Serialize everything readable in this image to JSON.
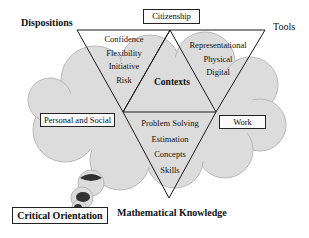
{
  "diagram": {
    "type": "numeracy model",
    "outer_labels": {
      "top_left": "Dispositions",
      "top_right": "Tools",
      "bottom_center": "Mathematical Knowledge"
    },
    "boxes": {
      "top": "Citizenship",
      "left": "Personal and Social",
      "right": "Work",
      "bottom_left": "Critical Orientation"
    },
    "center_label": "Contexts",
    "triangles": {
      "dispositions": [
        "Confidence",
        "Flexibility",
        "Initiative",
        "Risk"
      ],
      "tools": [
        "Representational",
        "Physical",
        "Digital"
      ],
      "mathematical_knowledge": [
        "Problem Solving",
        "Estimation",
        "Concepts",
        "Skills"
      ]
    },
    "colors": {
      "cloud_fill": "#d9d9d9",
      "cloud_stroke": "#b5b5b5",
      "line": "#1a1a1a",
      "dark_spot": "#333333"
    }
  }
}
